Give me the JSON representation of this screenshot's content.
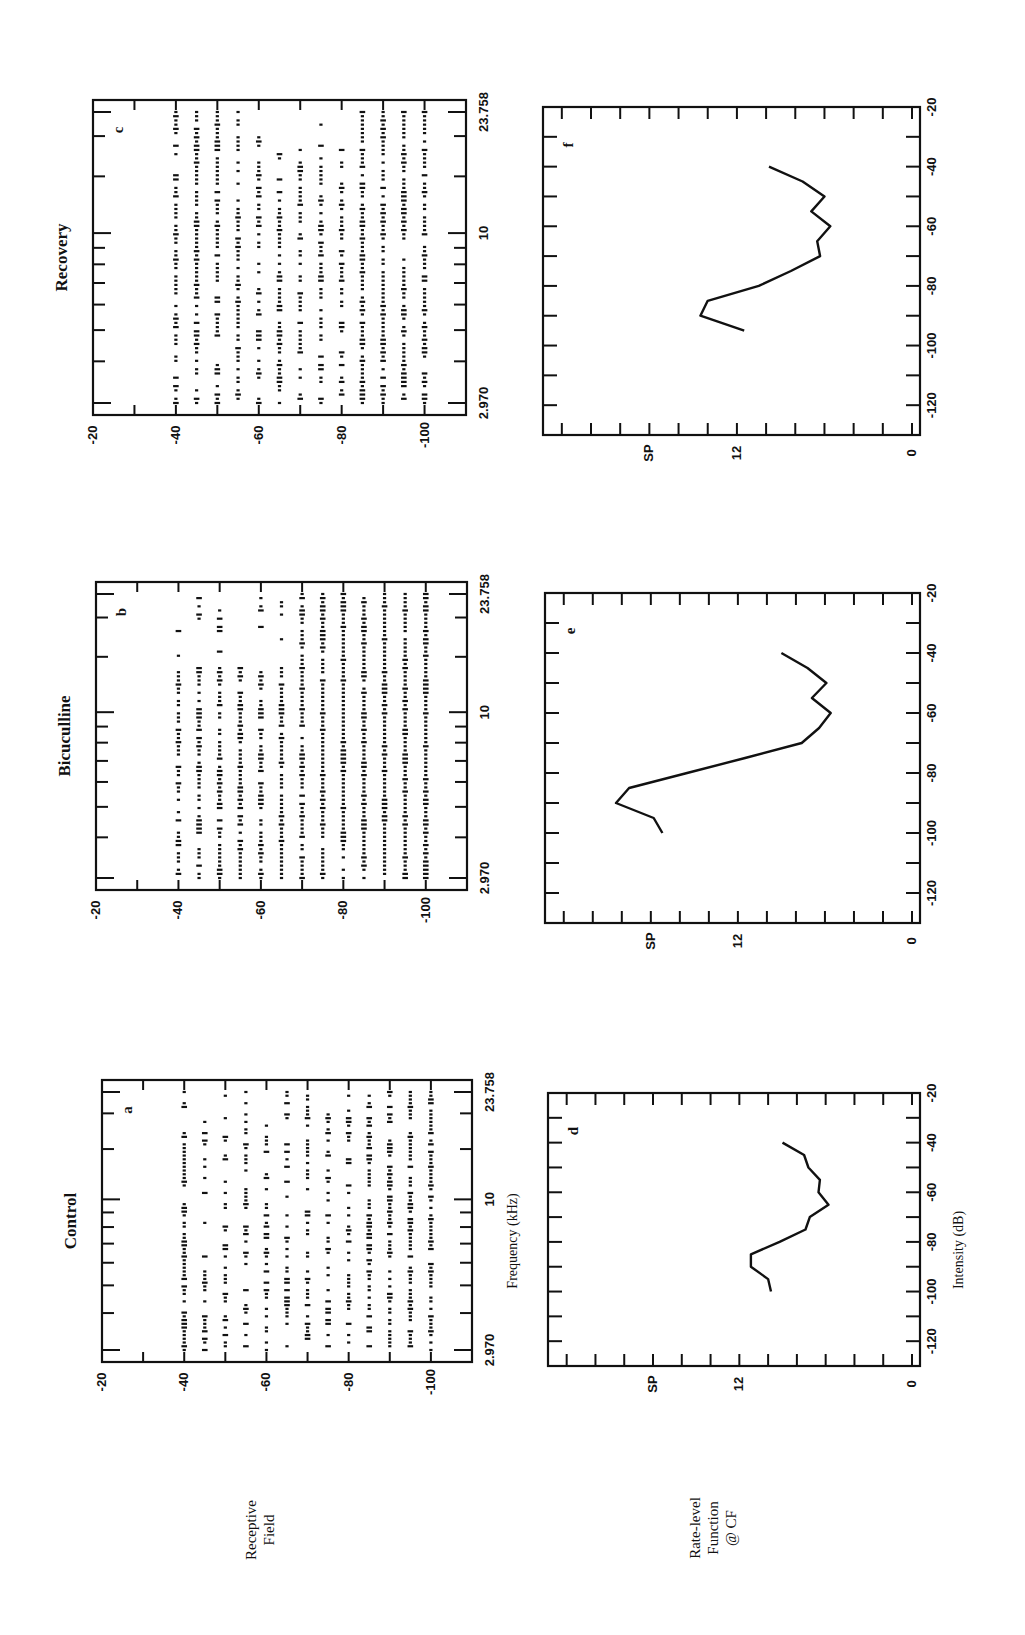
{
  "figure": {
    "orientation": "rotated 90deg counter-clockwise",
    "row_labels": {
      "receptive_field": [
        "Receptive",
        "Field"
      ],
      "rate_level": [
        "Rate-level",
        "Function",
        "@ CF"
      ]
    },
    "columns": [
      {
        "title": "Control",
        "raster_letter": "a",
        "curve_letter": "d"
      },
      {
        "title": "Bicuculline",
        "raster_letter": "b",
        "curve_letter": "e"
      },
      {
        "title": "Recovery",
        "raster_letter": "c",
        "curve_letter": "f"
      }
    ],
    "raster_axes": {
      "intensity_ticks": [
        "-20",
        "-40",
        "-60",
        "-80",
        "-100"
      ],
      "frequency_ticks": [
        "2.970",
        "10",
        "23.758"
      ],
      "frequency_title": "Frequency (kHz)"
    },
    "curve_axes": {
      "spike_ticks": [
        "SP",
        "12",
        "0"
      ],
      "intensity_ticks": [
        "-20",
        "-40",
        "-60",
        "-80",
        "-100",
        "-120"
      ],
      "intensity_title": "Intensity (dB)"
    }
  },
  "chart_data": [
    {
      "type": "scatter",
      "panel": "a",
      "title": "Control — Receptive Field",
      "xlabel": "Frequency (kHz)",
      "ylabel": "Intensity (dB)",
      "x_scale": "log",
      "xlim": [
        2.97,
        23.758
      ],
      "ylim": [
        -20,
        -110
      ],
      "x_ticks": [
        2.97,
        10,
        23.758
      ],
      "y_ticks": [
        -20,
        -40,
        -60,
        -80,
        -100
      ],
      "intensity_rows_db": [
        -40,
        -45,
        -50,
        -55,
        -60,
        -65,
        -70,
        -75,
        -80,
        -85,
        -90,
        -95,
        -100
      ],
      "description": "Dot raster of spike responses at each frequency/intensity; response area roughly 3–24 kHz from -40 to -100 dB, sparser at mid intensities"
    },
    {
      "type": "scatter",
      "panel": "b",
      "title": "Bicuculline — Receptive Field",
      "xlabel": "Frequency (kHz)",
      "ylabel": "Intensity (dB)",
      "x_scale": "log",
      "xlim": [
        2.97,
        23.758
      ],
      "ylim": [
        -20,
        -110
      ],
      "x_ticks": [
        2.97,
        10,
        23.758
      ],
      "y_ticks": [
        -20,
        -40,
        -60,
        -80,
        -100
      ],
      "intensity_rows_db": [
        -40,
        -45,
        -50,
        -55,
        -60,
        -65,
        -70,
        -75,
        -80,
        -85,
        -90,
        -95,
        -100
      ],
      "description": "Dense raster; strongest responses around 5–15 kHz at -75 to -100 dB; response area broadened"
    },
    {
      "type": "scatter",
      "panel": "c",
      "title": "Recovery — Receptive Field",
      "xlabel": "Frequency (kHz)",
      "ylabel": "Intensity (dB)",
      "x_scale": "log",
      "xlim": [
        2.97,
        23.758
      ],
      "ylim": [
        -20,
        -110
      ],
      "x_ticks": [
        2.97,
        10,
        23.758
      ],
      "y_ticks": [
        -20,
        -40,
        -60,
        -80,
        -100
      ],
      "intensity_rows_db": [
        -40,
        -45,
        -50,
        -55,
        -60,
        -65,
        -70,
        -75,
        -80,
        -85,
        -90,
        -95,
        -100
      ],
      "description": "Raster returning toward control pattern; moderate density throughout -40 to -100 dB"
    },
    {
      "type": "line",
      "panel": "d",
      "title": "Control — Rate-level Function @ CF",
      "xlabel": "Intensity (dB)",
      "ylabel": "Spikes",
      "xlim": [
        -20,
        -120
      ],
      "ylim": [
        0,
        24
      ],
      "x": [
        -40,
        -45,
        -50,
        -55,
        -60,
        -65,
        -70,
        -75,
        -80,
        -85,
        -90,
        -95,
        -100
      ],
      "values": [
        9.0,
        7.5,
        7.2,
        6.4,
        6.5,
        5.8,
        7.1,
        7.4,
        9.2,
        11.2,
        11.2,
        10.0,
        9.8
      ]
    },
    {
      "type": "line",
      "panel": "e",
      "title": "Bicuculline — Rate-level Function @ CF",
      "xlabel": "Intensity (dB)",
      "ylabel": "Spikes",
      "xlim": [
        -20,
        -120
      ],
      "ylim": [
        0,
        24
      ],
      "x": [
        -40,
        -45,
        -50,
        -55,
        -60,
        -65,
        -70,
        -75,
        -80,
        -85,
        -90,
        -95,
        -100
      ],
      "values": [
        9.0,
        7.2,
        5.9,
        6.9,
        5.6,
        6.4,
        7.6,
        11.5,
        15.5,
        19.5,
        20.4,
        17.8,
        17.2
      ]
    },
    {
      "type": "line",
      "panel": "f",
      "title": "Recovery — Rate-level Function @ CF",
      "xlabel": "Intensity (dB)",
      "ylabel": "Spikes",
      "xlim": [
        -20,
        -120
      ],
      "ylim": [
        0,
        24
      ],
      "x": [
        -40,
        -45,
        -50,
        -55,
        -60,
        -65,
        -70,
        -75,
        -80,
        -85,
        -90,
        -95,
        -100
      ],
      "values": [
        9.8,
        7.5,
        6.0,
        6.9,
        5.6,
        6.5,
        6.3,
        8.3,
        10.5,
        14.0,
        14.5,
        11.5
      ]
    }
  ]
}
